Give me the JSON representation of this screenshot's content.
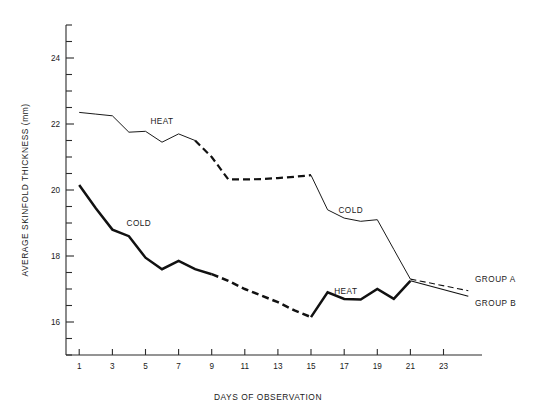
{
  "chart_data": {
    "type": "line",
    "title": "",
    "xlabel": "DAYS OF OBSERVATION",
    "ylabel": "AVERAGE SKINFOLD THICKNESS (mm)",
    "xlim": [
      0.2,
      24.6
    ],
    "ylim": [
      15.0,
      25.0
    ],
    "xticks": [
      1,
      3,
      5,
      7,
      9,
      11,
      13,
      15,
      17,
      19,
      21,
      23
    ],
    "xticklabels": [
      "1",
      "3",
      "5",
      "7",
      "9",
      "11",
      "13",
      "15",
      "17",
      "19",
      "21",
      "23"
    ],
    "yticks": [
      15.0,
      15.5,
      16.0,
      16.5,
      17.0,
      17.5,
      18.0,
      18.5,
      19.0,
      19.5,
      20.0,
      20.5,
      21.0,
      21.5,
      22.0,
      22.5,
      23.0,
      23.5,
      24.0,
      24.5,
      25.0
    ],
    "yticklabels": [
      "16",
      "18",
      "20",
      "22",
      "24"
    ],
    "ylabeled_ticks": [
      16,
      18,
      20,
      22,
      24
    ],
    "grid": false,
    "legend_position": "inline-annotation",
    "annotations": [
      {
        "text": "HEAT",
        "x": 6.0,
        "y": 22.0,
        "note": "label on upper curve, group A heat-treated"
      },
      {
        "text": "COLD",
        "x": 4.6,
        "y": 18.9,
        "note": "label on lower curve, group B cold-treated"
      },
      {
        "text": "COLD",
        "x": 17.4,
        "y": 19.3,
        "note": "label on upper-right descending curve"
      },
      {
        "text": "HEAT",
        "x": 17.1,
        "y": 16.85,
        "note": "label on lower-right zigzag curve"
      },
      {
        "text": "GROUP A",
        "x": 24.9,
        "y": 17.22,
        "note": "right edge terminal label, dashed tail"
      },
      {
        "text": "GROUP B",
        "x": 24.9,
        "y": 16.48,
        "note": "right edge terminal label, solid tail"
      }
    ],
    "series": [
      {
        "name": "GROUP A",
        "label": "GROUP A",
        "style": "thin",
        "description": "Starts high under HEAT, declines, plateaus under dashed interval, rises slightly, then declines under COLD to converge at day 21",
        "segments": [
          {
            "phase": "HEAT",
            "linestyle": "solid",
            "x": [
              1,
              2,
              3,
              4,
              5,
              6,
              7,
              8
            ],
            "values": [
              22.35,
              22.3,
              22.25,
              21.75,
              21.78,
              21.45,
              21.7,
              21.5
            ]
          },
          {
            "phase": "transition",
            "linestyle": "dashed",
            "x": [
              8,
              9,
              10,
              11,
              12,
              13,
              14,
              15
            ],
            "values": [
              21.5,
              21.0,
              20.32,
              20.32,
              20.33,
              20.36,
              20.4,
              20.45
            ]
          },
          {
            "phase": "COLD",
            "linestyle": "solid",
            "x": [
              15,
              16,
              17,
              18,
              19,
              20,
              21
            ],
            "values": [
              20.45,
              19.4,
              19.15,
              19.05,
              19.1,
              18.2,
              17.3
            ]
          },
          {
            "phase": "tail",
            "linestyle": "dashed",
            "x": [
              21,
              24.5
            ],
            "values": [
              17.3,
              16.95
            ]
          }
        ]
      },
      {
        "name": "GROUP B",
        "label": "GROUP B",
        "style": "thick",
        "description": "Starts lower under COLD, declines steeply, dashed transition interval, then rises slightly under HEAT zigzag to converge at day 21",
        "segments": [
          {
            "phase": "COLD",
            "linestyle": "solid",
            "x": [
              1,
              2,
              3,
              4,
              5,
              6,
              7,
              8,
              9
            ],
            "values": [
              20.15,
              19.45,
              18.8,
              18.6,
              17.95,
              17.6,
              17.85,
              17.6,
              17.45
            ]
          },
          {
            "phase": "transition",
            "linestyle": "dashed",
            "x": [
              9,
              10,
              11,
              12,
              13,
              14,
              15
            ],
            "values": [
              17.45,
              17.25,
              17.0,
              16.8,
              16.6,
              16.35,
              16.15
            ]
          },
          {
            "phase": "HEAT",
            "linestyle": "solid",
            "x": [
              15,
              16,
              17,
              18,
              19,
              20,
              21
            ],
            "values": [
              16.15,
              16.9,
              16.7,
              16.68,
              17.0,
              16.7,
              17.25
            ]
          },
          {
            "phase": "tail",
            "linestyle": "solid",
            "x": [
              21,
              24.5
            ],
            "values": [
              17.25,
              16.78
            ]
          }
        ]
      }
    ]
  },
  "axes": {
    "y_title": "AVERAGE SKINFOLD THICKNESS (mm)",
    "x_title": "DAYS OF OBSERVATION"
  },
  "labels": {
    "heat_upper": "HEAT",
    "cold_lower": "COLD",
    "cold_upper_right": "COLD",
    "heat_lower_right": "HEAT",
    "group_a": "GROUP A",
    "group_b": "GROUP B"
  },
  "colors": {
    "ink": "#111111",
    "axis": "#2b2b2b",
    "background": "#ffffff"
  }
}
